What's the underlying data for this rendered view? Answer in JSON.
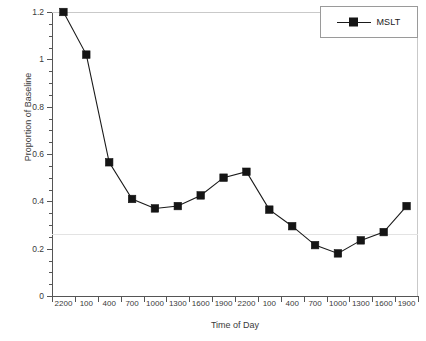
{
  "chart_data": {
    "type": "line",
    "title": "",
    "xlabel": "Time of Day",
    "ylabel": "Proportion of Baseline",
    "categories": [
      "2200",
      "100",
      "400",
      "700",
      "1000",
      "1300",
      "1600",
      "1900",
      "2200",
      "100",
      "400",
      "700",
      "1000",
      "1300",
      "1600",
      "1900"
    ],
    "series": [
      {
        "name": "MSLT",
        "marker": "filled-square",
        "color": "#151515",
        "values": [
          1.2,
          1.02,
          0.565,
          0.41,
          0.37,
          0.38,
          0.425,
          0.5,
          0.525,
          0.365,
          0.295,
          0.215,
          0.18,
          0.235,
          0.27,
          0.38
        ]
      }
    ],
    "ylim": [
      0,
      1.2
    ],
    "ytick_values": [
      0,
      0.2,
      0.4,
      0.6,
      0.8,
      1,
      1.2
    ],
    "ytick_labels": [
      "0",
      "0.2",
      "0.4",
      "0.6",
      "0.8",
      "1",
      "1.2"
    ],
    "yminor_step": 0.05,
    "grid": "faint-horizontal",
    "gridline_values": [
      0.26
    ],
    "legend_position": "top-right",
    "legend_entries": [
      "MSLT"
    ]
  },
  "legend": {
    "label": "MSLT"
  },
  "axes": {
    "x_title": "Time of Day",
    "y_title": "Proportion of Baseline"
  }
}
